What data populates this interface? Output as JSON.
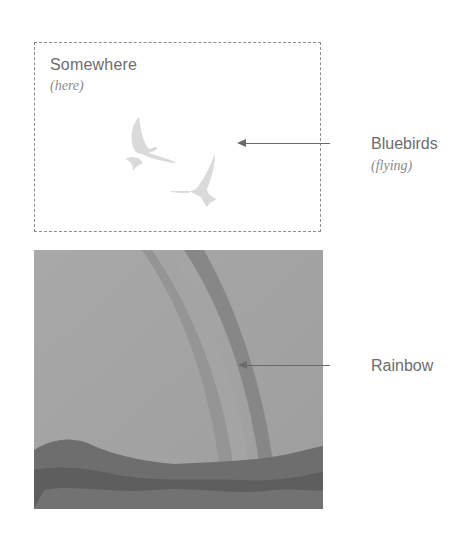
{
  "frame": {
    "title": "Somewhere",
    "subtitle": "(here)"
  },
  "callouts": [
    {
      "label": "Bluebirds",
      "sublabel": "(flying)",
      "target": "birds"
    },
    {
      "label": "Rainbow",
      "sublabel": "",
      "target": "rainbow-photo"
    }
  ],
  "colors": {
    "text": "#6d6d6d",
    "arrow": "#6a6a6a",
    "dashed_border": "#8c8c8c",
    "birds": "#d9d9d9"
  }
}
